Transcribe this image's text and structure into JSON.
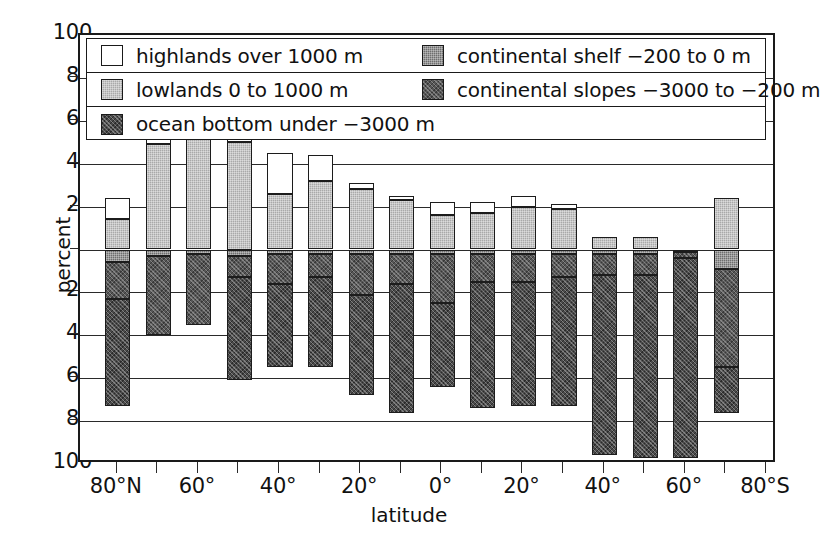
{
  "chart_data": {
    "type": "bar",
    "subtype": "stacked-diverging",
    "title": "",
    "xlabel": "latitude",
    "ylabel": "percent",
    "ylim": [
      -100,
      100
    ],
    "yticks": [
      100,
      80,
      60,
      40,
      20,
      0,
      20,
      40,
      60,
      80,
      100
    ],
    "ytick_values": [
      100,
      80,
      60,
      40,
      20,
      0,
      -20,
      -40,
      -60,
      -80,
      -100
    ],
    "grid": true,
    "legend_position": "top-inside",
    "xticks": [
      "80°N",
      "70°",
      "60°",
      "50°",
      "40°",
      "30°",
      "20°",
      "10°",
      "0°",
      "10°",
      "20°",
      "30°",
      "40°",
      "50°",
      "60°",
      "70°",
      "80°S"
    ],
    "xtick_labels_shown": [
      "80°N",
      "60°",
      "40°",
      "20°",
      "0°",
      "20°",
      "40°",
      "60°",
      "80°S"
    ],
    "categories": [
      "80°N",
      "70°N",
      "60°N",
      "50°N",
      "40°N",
      "30°N",
      "20°N",
      "10°N",
      "0°",
      "10°S",
      "20°S",
      "30°S",
      "40°S",
      "50°S",
      "60°S",
      "70°S"
    ],
    "series": [
      {
        "name": "highlands over 1000 m",
        "key": "highlands",
        "color": "#ffffff",
        "values": [
          10,
          7,
          2,
          7,
          19,
          12,
          3,
          2,
          6,
          5,
          5,
          2,
          0,
          0,
          0,
          0
        ]
      },
      {
        "name": "lowlands 0 to 1000 m",
        "key": "lowlands",
        "color": "#a9a9a9",
        "values": [
          14,
          49,
          59,
          50,
          26,
          32,
          28,
          23,
          16,
          17,
          20,
          19,
          6,
          6,
          0,
          24
        ]
      },
      {
        "name": "continental shelf −200 to 0 m",
        "key": "shelf",
        "color": "#6e6e6e",
        "values": [
          -6,
          -3,
          -2,
          -3,
          -2,
          -2,
          -2,
          -2,
          -2,
          -2,
          -2,
          -2,
          -2,
          -2,
          -1,
          -9
        ]
      },
      {
        "name": "continental slopes −3000 to −200 m",
        "key": "slopes",
        "color": "#565656",
        "values": [
          -17,
          -37,
          -33,
          -10,
          -14,
          -11,
          -19,
          -14,
          -23,
          -13,
          -13,
          -11,
          -10,
          -10,
          -3,
          -46
        ]
      },
      {
        "name": "ocean bottom under −3000 m",
        "key": "ocean",
        "color": "#4a4a4a",
        "values": [
          -50,
          0,
          0,
          -48,
          -39,
          -42,
          -47,
          -60,
          -39,
          -59,
          -58,
          -60,
          -84,
          -85,
          -93,
          -21
        ]
      }
    ]
  },
  "legend": {
    "rows": [
      [
        {
          "swatch": "highlands",
          "label": "highlands over  1000 m"
        },
        {
          "swatch": "shelf",
          "label": "continental shelf  −200 to 0 m"
        }
      ],
      [
        {
          "swatch": "lowlands",
          "label": "lowlands 0 to 1000 m"
        },
        {
          "swatch": "slopes",
          "label": "continental slopes −3000 to −200 m"
        }
      ],
      [
        {
          "swatch": "ocean",
          "label": "ocean bottom  under −3000 m"
        }
      ]
    ]
  },
  "axes": {
    "y_label": "percent",
    "x_label": "latitude",
    "y_tick_labels": [
      "100",
      "80",
      "60",
      "40",
      "20",
      "0",
      "20",
      "40",
      "60",
      "80",
      "100"
    ],
    "x_tick_labels": [
      "80°N",
      "60°",
      "40°",
      "20°",
      "0°",
      "20°",
      "40°",
      "60°",
      "80°S"
    ]
  },
  "colors": {
    "highlands": "#ffffff",
    "lowlands": "#a9a9a9",
    "shelf": "#6e6e6e",
    "slopes": "#565656",
    "ocean": "#4a4a4a",
    "frame": "#1a1a1a"
  }
}
